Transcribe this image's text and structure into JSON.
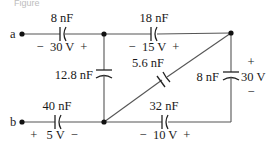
{
  "caption": "Figure",
  "terminals": {
    "a": "a",
    "b": "b"
  },
  "capacitors": [
    {
      "id": "c8_top",
      "capacitance": "8 nF",
      "voltage": "−  30 V  +"
    },
    {
      "id": "c18",
      "capacitance": "18 nF",
      "voltage": "−  15 V  +"
    },
    {
      "id": "c12_8",
      "capacitance": "12.8 nF",
      "voltage": ""
    },
    {
      "id": "c5_6",
      "capacitance": "5.6 nF",
      "voltage": ""
    },
    {
      "id": "c8_right",
      "capacitance": "8 nF",
      "voltage": "30 V",
      "plus": "+",
      "minus": "−"
    },
    {
      "id": "c40",
      "capacitance": "40 nF",
      "voltage": "+   5 V  −"
    },
    {
      "id": "c32",
      "capacitance": "32 nF",
      "voltage": "−  10 V  +"
    }
  ]
}
